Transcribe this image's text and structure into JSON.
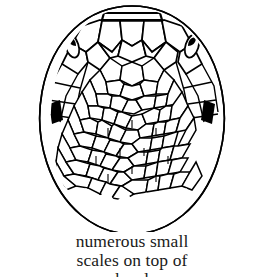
{
  "figure": {
    "name": "snake-head-dorsal-view",
    "style": "black-and-white ink line drawing",
    "background_color": "#ffffff",
    "ink_color": "#000000",
    "caption": {
      "lines": [
        "numerous small",
        "scales on top of",
        "head"
      ],
      "line1": "numerous small",
      "line2": "scales on top of",
      "line3_clipped": "head"
    },
    "features": [
      {
        "label": "rostral-plate",
        "description": "narrow band plate at snout apex"
      },
      {
        "label": "large-head-plates",
        "description": "large polygonal plates behind rostral"
      },
      {
        "label": "eye-left",
        "description": "dark elongate marking on left side of head"
      },
      {
        "label": "eye-right",
        "description": "dark elongate marking on right side of head"
      },
      {
        "label": "dark-wedge-left",
        "description": "dark wedge marking lower left margin"
      },
      {
        "label": "dark-wedge-right",
        "description": "dark wedge marking lower right margin"
      },
      {
        "label": "dorsal-scale-field",
        "description": "numerous small imbricate scales on top of head"
      },
      {
        "label": "body-outline",
        "description": "egg-shaped outline of head and neck"
      }
    ]
  }
}
